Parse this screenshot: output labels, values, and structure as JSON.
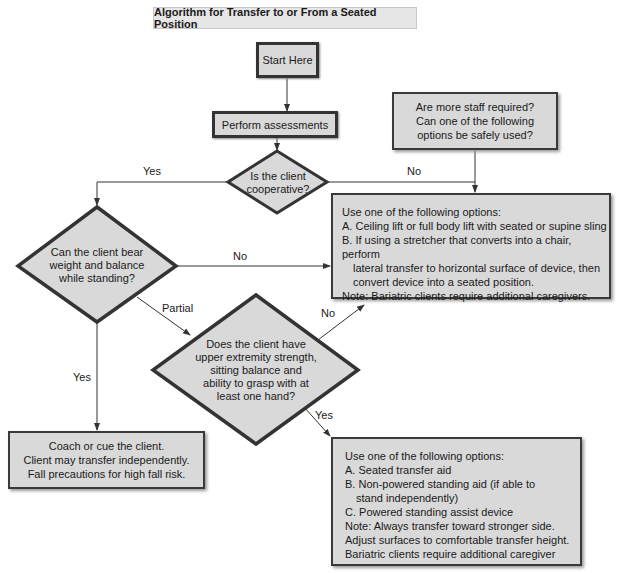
{
  "title": "Algorithm for Transfer to or From a Seated Position",
  "colors": {
    "box_fill": "#d9d9d9",
    "border": "#333333",
    "title_fill": "#e6e6e6",
    "line": "#333333"
  },
  "nodes": {
    "start": {
      "text": "Start Here"
    },
    "assess": {
      "text": "Perform assessments"
    },
    "cooperative": {
      "lines": [
        "Is the client",
        "cooperative?"
      ]
    },
    "more_staff": {
      "lines": [
        "Are more staff required?",
        "Can one of the following",
        "options be safely used?"
      ]
    },
    "options_lift": {
      "lines": [
        "Use one of the following options:",
        "A. Ceiling lift or full body lift with seated or supine sling",
        "B. If using a stretcher that converts into a chair, perform",
        "lateral transfer to horizontal surface of device, then",
        "convert device into a seated position.",
        "Note: Bariatric clients require additional caregivers."
      ]
    },
    "bear_weight": {
      "lines": [
        "Can the client bear",
        "weight and balance",
        "while standing?"
      ]
    },
    "upper_strength": {
      "lines": [
        "Does the client have",
        "upper extremity strength,",
        "sitting balance and",
        "ability to grasp with at",
        "least one hand?"
      ]
    },
    "coach": {
      "lines": [
        "Coach or cue the client.",
        "Client may transfer independently.",
        "Fall precautions for high fall risk."
      ]
    },
    "options_aid": {
      "lines": [
        "Use one of the following options:",
        "A. Seated transfer aid",
        "B. Non-powered standing aid (if able to",
        "stand independently)",
        "C. Powered standing assist device",
        "Note: Always transfer toward stronger side.",
        "Adjust surfaces to comfortable transfer height.",
        "Bariatric clients require additional caregiver"
      ]
    }
  },
  "edge_labels": {
    "coop_yes": "Yes",
    "coop_no": "No",
    "bear_no": "No",
    "bear_partial": "Partial",
    "bear_yes": "Yes",
    "upper_no": "No",
    "upper_yes": "Yes"
  }
}
